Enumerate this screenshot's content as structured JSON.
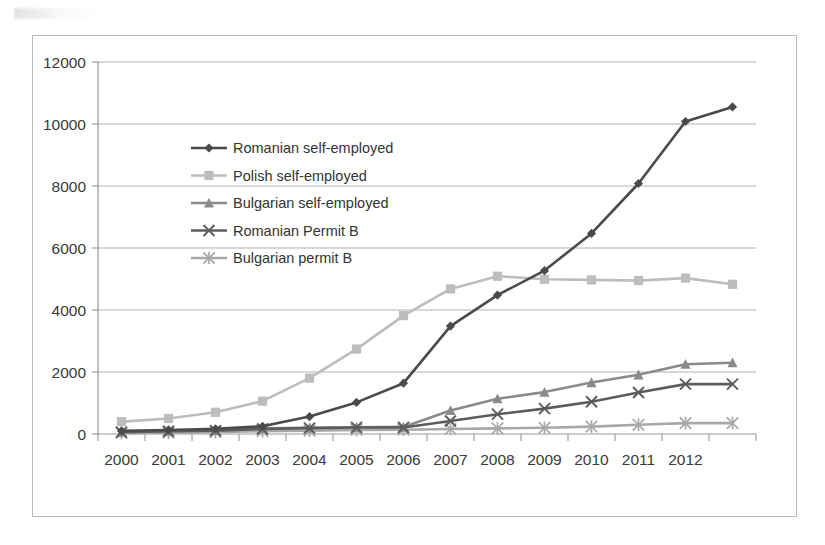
{
  "chart_data": {
    "type": "line",
    "title": "",
    "xlabel": "",
    "ylabel": "",
    "categories": [
      "2000",
      "2001",
      "2002",
      "2003",
      "2004",
      "2005",
      "2006",
      "2007",
      "2008",
      "2009",
      "2010",
      "2011",
      "2012",
      ""
    ],
    "x_tick_labels": [
      "2000",
      "2001",
      "2002",
      "2003",
      "2004",
      "2005",
      "2006",
      "2007",
      "2008",
      "2009",
      "2010",
      "2011",
      "2012"
    ],
    "y_tick_labels": [
      "0",
      "2000",
      "4000",
      "6000",
      "8000",
      "10000",
      "12000"
    ],
    "y_ticks": [
      0,
      2000,
      4000,
      6000,
      8000,
      10000,
      12000
    ],
    "ylim": [
      0,
      12000
    ],
    "grid": "horizontal",
    "legend_position": "inside-upper-left",
    "series": [
      {
        "name": "Romanian self-employed",
        "marker": "diamond",
        "color": "#4a4a4a",
        "values": [
          100,
          130,
          170,
          250,
          560,
          1020,
          1640,
          3480,
          4480,
          5270,
          6470,
          8080,
          10080,
          10550
        ]
      },
      {
        "name": "Polish self-employed",
        "marker": "square",
        "color": "#bdbdbd",
        "values": [
          400,
          500,
          700,
          1060,
          1800,
          2740,
          3820,
          4680,
          5090,
          4990,
          4970,
          4950,
          5030,
          4830
        ]
      },
      {
        "name": "Bulgarian self-employed",
        "marker": "triangle",
        "color": "#8a8a8a",
        "values": [
          60,
          90,
          120,
          180,
          200,
          220,
          230,
          760,
          1140,
          1350,
          1660,
          1910,
          2250,
          2300
        ]
      },
      {
        "name": "Romanian Permit B",
        "marker": "cross",
        "color": "#5c5c5c",
        "values": [
          60,
          90,
          110,
          160,
          190,
          210,
          210,
          420,
          640,
          820,
          1040,
          1340,
          1610,
          1610
        ]
      },
      {
        "name": "Bulgarian permit B",
        "marker": "asterisk",
        "color": "#a8a8a8",
        "values": [
          30,
          40,
          60,
          90,
          110,
          130,
          140,
          160,
          180,
          200,
          240,
          300,
          350,
          350
        ]
      }
    ]
  },
  "colors": {
    "frame": "#b9b9b9",
    "gridline": "#9a9a9a",
    "axis": "#8c8c8c",
    "tick_text": "#3a3a3a",
    "legend_text": "#343434",
    "background": "#ffffff"
  }
}
